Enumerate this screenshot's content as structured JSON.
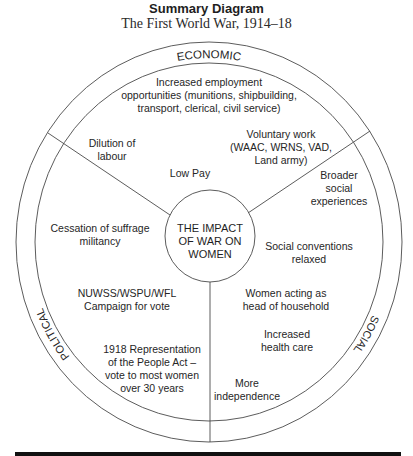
{
  "header": {
    "title": "Summary Diagram",
    "subtitle": "The First World War, 1914–18"
  },
  "diagram": {
    "center": {
      "lines": [
        "THE IMPACT",
        "OF WAR ON",
        "WOMEN"
      ]
    },
    "sections": {
      "economic": {
        "label": "ECONOMIC",
        "items": [
          {
            "lines": [
              "Increased employment",
              "opportunities (munitions, shipbuilding,",
              "transport, clerical, civil service)"
            ]
          },
          {
            "lines": [
              "Dilution of",
              "labour"
            ]
          },
          {
            "lines": [
              "Low Pay"
            ]
          },
          {
            "lines": [
              "Voluntary work",
              "(WAAC, WRNS, VAD,",
              "Land army)"
            ]
          }
        ]
      },
      "social": {
        "label": "SOCIAL",
        "items": [
          {
            "lines": [
              "Broader",
              "social",
              "experiences"
            ]
          },
          {
            "lines": [
              "Social conventions",
              "relaxed"
            ]
          },
          {
            "lines": [
              "Women acting as",
              "head of household"
            ]
          },
          {
            "lines": [
              "Increased",
              "health care"
            ]
          },
          {
            "lines": [
              "More",
              "independence"
            ]
          }
        ]
      },
      "political": {
        "label": "POLITICAL",
        "items": [
          {
            "lines": [
              "Cessation of suffrage",
              "militancy"
            ]
          },
          {
            "lines": [
              "NUWSS/WSPU/WFL",
              "Campaign for vote"
            ]
          },
          {
            "lines": [
              "1918 Representation",
              "of the People Act –",
              "vote to most women",
              "over 30 years"
            ]
          }
        ]
      }
    },
    "colors": {
      "line": "#4a4a4a",
      "text": "#262626",
      "footer_bar": "#111111"
    }
  }
}
